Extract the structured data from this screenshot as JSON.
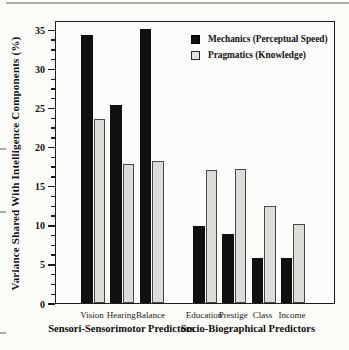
{
  "chart_data": {
    "type": "bar",
    "title": "",
    "xlabel": "",
    "ylabel": "Variance Shared With Intelligence Components (%)",
    "ylim": [
      0,
      36.2
    ],
    "yticks": [
      0,
      5,
      10,
      15,
      20,
      25,
      30,
      35
    ],
    "minor_tick_step": 1.25,
    "grid": false,
    "legend_position": "top-right-inside",
    "groups": [
      {
        "label": "Sensori-Sensorimotor Predictors",
        "categories": [
          "Vision",
          "Hearing",
          "Balance"
        ]
      },
      {
        "label": "Socio-Biographical Predictors",
        "categories": [
          "Education",
          "Prestige",
          "Class",
          "Income"
        ]
      }
    ],
    "series": [
      {
        "name": "Mechanics (Perceptual Speed)",
        "color": "#101010",
        "values": [
          34.3,
          25.3,
          35.1,
          9.9,
          8.8,
          5.7,
          5.8
        ]
      },
      {
        "name": "Pragmatics (Knowledge)",
        "color": "#dcdcd8",
        "values": [
          23.5,
          17.8,
          18.2,
          17.0,
          17.1,
          12.4,
          10.1
        ]
      }
    ]
  }
}
